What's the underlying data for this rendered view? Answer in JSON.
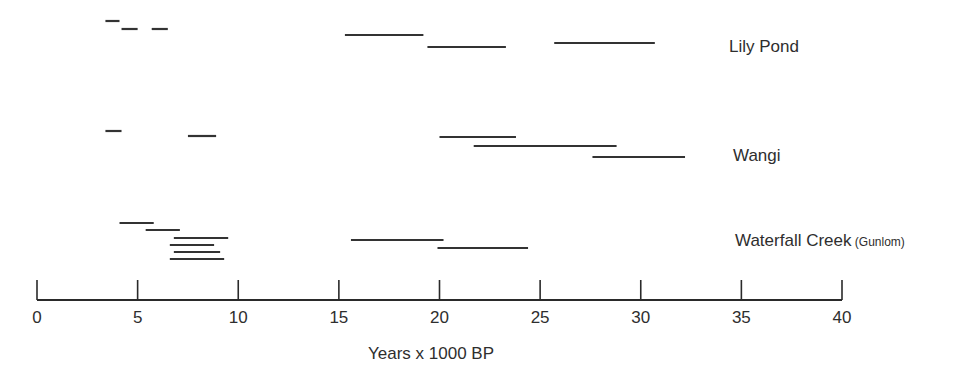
{
  "chart_data": {
    "type": "range-bar",
    "title": "",
    "xlabel": "Years x 1000 BP",
    "ylabel": "",
    "xlim": [
      0,
      40
    ],
    "xticks": [
      0,
      5,
      10,
      15,
      20,
      25,
      30,
      35,
      40
    ],
    "grid": false,
    "legend": null,
    "series": [
      {
        "name": "Lily Pond",
        "sub": "",
        "ranges": [
          {
            "start": 3.4,
            "end": 4.1,
            "y": 21
          },
          {
            "start": 4.2,
            "end": 5.0,
            "y": 29
          },
          {
            "start": 5.7,
            "end": 6.5,
            "y": 29
          },
          {
            "start": 15.3,
            "end": 19.2,
            "y": 35
          },
          {
            "start": 19.4,
            "end": 23.3,
            "y": 47
          },
          {
            "start": 25.7,
            "end": 30.7,
            "y": 43
          }
        ]
      },
      {
        "name": "Wangi",
        "sub": "",
        "ranges": [
          {
            "start": 3.4,
            "end": 4.2,
            "y": 131
          },
          {
            "start": 7.5,
            "end": 8.9,
            "y": 136
          },
          {
            "start": 20.0,
            "end": 23.8,
            "y": 137
          },
          {
            "start": 21.7,
            "end": 28.8,
            "y": 146
          },
          {
            "start": 27.6,
            "end": 32.2,
            "y": 157
          }
        ]
      },
      {
        "name": "Waterfall Creek",
        "sub": "(Gunlom)",
        "ranges": [
          {
            "start": 4.1,
            "end": 5.8,
            "y": 223
          },
          {
            "start": 5.4,
            "end": 7.1,
            "y": 230
          },
          {
            "start": 6.8,
            "end": 9.5,
            "y": 238
          },
          {
            "start": 6.6,
            "end": 8.8,
            "y": 245
          },
          {
            "start": 6.8,
            "end": 9.1,
            "y": 252
          },
          {
            "start": 6.6,
            "end": 9.3,
            "y": 259
          },
          {
            "start": 15.6,
            "end": 20.2,
            "y": 240
          },
          {
            "start": 19.9,
            "end": 24.4,
            "y": 248
          }
        ]
      }
    ]
  },
  "labels": {
    "sites": [
      {
        "name": "Lily Pond",
        "sub": "",
        "x": 729,
        "y": 37
      },
      {
        "name": "Wangi",
        "sub": "",
        "x": 733,
        "y": 146
      },
      {
        "name": "Waterfall Creek",
        "sub": "(Gunlom)",
        "x": 735,
        "y": 231
      }
    ],
    "xlabel": "Years x 1000 BP"
  },
  "axis": {
    "color": "#2a2a2a",
    "x0_px": 37,
    "x40_px": 842,
    "baseline_y": 300,
    "tick_top_y": 280,
    "ticks": [
      {
        "value": 0,
        "label": "0"
      },
      {
        "value": 5,
        "label": "5"
      },
      {
        "value": 10,
        "label": "10"
      },
      {
        "value": 15,
        "label": "15"
      },
      {
        "value": 20,
        "label": "20"
      },
      {
        "value": 25,
        "label": "25"
      },
      {
        "value": 30,
        "label": "30"
      },
      {
        "value": 35,
        "label": "35"
      },
      {
        "value": 40,
        "label": "40"
      }
    ]
  }
}
